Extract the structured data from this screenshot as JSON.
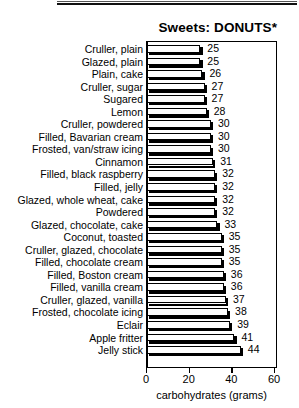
{
  "chart_data": {
    "type": "bar",
    "orientation": "horizontal",
    "title": "Sweets: DONUTS*",
    "xlabel": "carbohydrates (grams)",
    "ylabel": "",
    "xlim": [
      0,
      60
    ],
    "xticks": [
      0,
      20,
      40,
      60
    ],
    "grid": false,
    "legend": null,
    "categories": [
      "Cruller, plain",
      "Glazed, plain",
      "Plain, cake",
      "Cruller, sugar",
      "Sugared",
      "Lemon",
      "Cruller, powdered",
      "Filled, Bavarian cream",
      "Frosted, van/straw icing",
      "Cinnamon",
      "Filled, black raspberry",
      "Filled, jelly",
      "Glazed, whole wheat, cake",
      "Powdered",
      "Glazed, chocolate, cake",
      "Coconut, toasted",
      "Cruller, glazed, chocolate",
      "Filled, chocolate cream",
      "Filled, Boston cream",
      "Filled, vanilla cream",
      "Cruller, glazed, vanilla",
      "Frosted, chocolate icing",
      "Eclair",
      "Apple fritter",
      "Jelly stick"
    ],
    "values": [
      25,
      25,
      26,
      27,
      27,
      28,
      30,
      30,
      30,
      31,
      32,
      32,
      32,
      32,
      33,
      35,
      35,
      35,
      36,
      36,
      37,
      38,
      39,
      41,
      44
    ]
  }
}
